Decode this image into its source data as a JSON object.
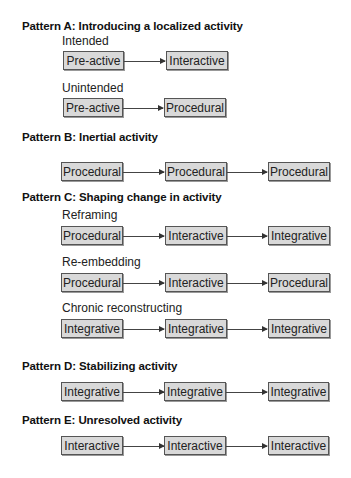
{
  "patterns": {
    "a": {
      "title": "Pattern A: Introducing a localized activity",
      "rows": [
        {
          "label": "Intended",
          "steps": [
            "Pre-active",
            "Interactive"
          ]
        },
        {
          "label": "Unintended",
          "steps": [
            "Pre-active",
            "Procedural"
          ]
        }
      ]
    },
    "b": {
      "title": "Pattern B: Inertial activity",
      "rows": [
        {
          "steps": [
            "Procedural",
            "Procedural",
            "Procedural"
          ]
        }
      ]
    },
    "c": {
      "title": "Pattern C: Shaping change in activity",
      "rows": [
        {
          "label": "Reframing",
          "steps": [
            "Procedural",
            "Interactive",
            "Integrative"
          ]
        },
        {
          "label": "Re-embedding",
          "steps": [
            "Procedural",
            "Interactive",
            "Procedural"
          ]
        },
        {
          "label": "Chronic reconstructing",
          "steps": [
            "Integrative",
            "Integrative",
            "Integrative"
          ]
        }
      ]
    },
    "d": {
      "title": "Pattern D: Stabilizing activity",
      "rows": [
        {
          "steps": [
            "Integrative",
            "Integrative",
            "Integrative"
          ]
        }
      ]
    },
    "e": {
      "title": "Pattern E: Unresolved activity",
      "rows": [
        {
          "steps": [
            "Interactive",
            "Interactive",
            "Interactive"
          ]
        }
      ]
    }
  },
  "colors": {
    "box_fill": "#d9d9d9",
    "box_border": "#555555",
    "arrow": "#444444"
  }
}
